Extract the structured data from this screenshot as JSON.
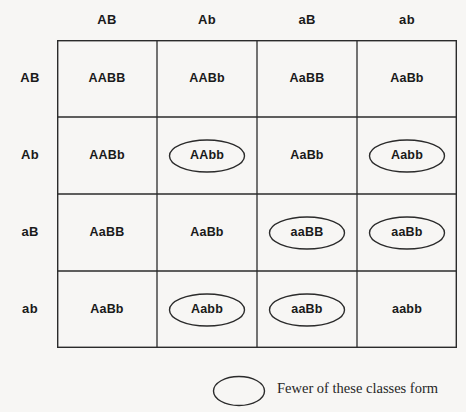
{
  "figure": {
    "type": "punnett-square",
    "grid_size": "4x4"
  },
  "axes": {
    "column_headers": [
      "AB",
      "Ab",
      "aB",
      "ab"
    ],
    "row_headers": [
      "AB",
      "Ab",
      "aB",
      "ab"
    ]
  },
  "cells": [
    [
      {
        "genotype": "AABB",
        "circled": false
      },
      {
        "genotype": "AABb",
        "circled": false
      },
      {
        "genotype": "AaBB",
        "circled": false
      },
      {
        "genotype": "AaBb",
        "circled": false
      }
    ],
    [
      {
        "genotype": "AABb",
        "circled": false
      },
      {
        "genotype": "AAbb",
        "circled": true
      },
      {
        "genotype": "AaBb",
        "circled": false
      },
      {
        "genotype": "Aabb",
        "circled": true
      }
    ],
    [
      {
        "genotype": "AaBB",
        "circled": false
      },
      {
        "genotype": "AaBb",
        "circled": false
      },
      {
        "genotype": "aaBB",
        "circled": true
      },
      {
        "genotype": "aaBb",
        "circled": true
      }
    ],
    [
      {
        "genotype": "AaBb",
        "circled": false
      },
      {
        "genotype": "Aabb",
        "circled": true
      },
      {
        "genotype": "aaBb",
        "circled": true
      },
      {
        "genotype": "aabb",
        "circled": false
      }
    ]
  ],
  "legend": {
    "label": "Fewer of these classes form",
    "marker": "ellipse-outline"
  },
  "colors": {
    "background": "#f7f6f4",
    "line": "#2b2b2b",
    "text": "#1a1a1a"
  }
}
